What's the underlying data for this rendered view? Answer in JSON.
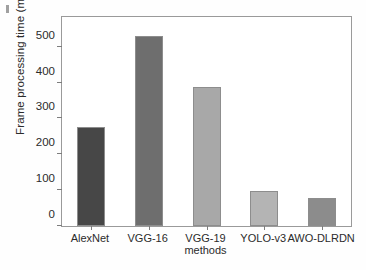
{
  "figure": {
    "background_color": "#fefefe",
    "frame_color": "#9a9a9a",
    "text_color": "#2b2b2b"
  },
  "chart_data": {
    "type": "bar",
    "title": "",
    "subtitle": "",
    "xlabel": "methods",
    "ylabel": "Frame processing time (ms)",
    "categories": [
      "AlexNet",
      "VGG-16",
      "VGG-19",
      "YOLO-v3",
      "AWO-DLRDN"
    ],
    "values": [
      276,
      530,
      389,
      99,
      77
    ],
    "bar_colors": [
      "#474747",
      "#6e6e6e",
      "#a8a8a8",
      "#b4b4b4",
      "#8c8c8c"
    ],
    "ylim": [
      0,
      583
    ],
    "yticks": [
      0,
      100,
      200,
      300,
      400,
      500
    ],
    "ytick_labels": [
      "0",
      "100",
      "200",
      "300",
      "400",
      "500"
    ],
    "grid": false,
    "legend": false,
    "legend_position": "none",
    "units": "ms"
  }
}
